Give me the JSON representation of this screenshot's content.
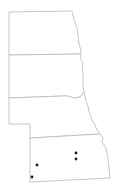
{
  "map": {
    "region": "Northern & Central Plains",
    "states": [
      {
        "name": "North Dakota",
        "id": "nd"
      },
      {
        "name": "South Dakota",
        "id": "sd"
      },
      {
        "name": "Nebraska",
        "id": "ne"
      },
      {
        "name": "Kansas",
        "id": "ks"
      }
    ],
    "colors": {
      "border": "#b8b8b8",
      "fill": "#ffffff",
      "marker": "#1a1a1a"
    },
    "markers": [
      {
        "x": 37,
        "y": 165
      },
      {
        "x": 32,
        "y": 177
      },
      {
        "x": 76,
        "y": 153
      },
      {
        "x": 76,
        "y": 159
      }
    ]
  }
}
